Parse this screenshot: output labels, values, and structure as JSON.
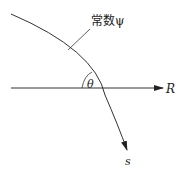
{
  "diagram": {
    "curve_label": "常数ψ",
    "angle_label": "θ",
    "axis_label": "R",
    "curve_direction_label": "s",
    "colors": {
      "stroke": "#333333",
      "background": "#ffffff"
    }
  }
}
